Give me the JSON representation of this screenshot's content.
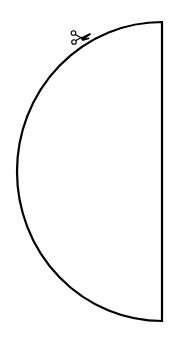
{
  "diagram": {
    "title": "Semicircle cut-out template",
    "shape": "half-circle",
    "stroke_color": "#000000",
    "background_color": "#ffffff",
    "straight_edge": {
      "x": 162,
      "y_top": 22,
      "y_bottom": 321
    },
    "arc": {
      "cx": 162,
      "cy": 171.5,
      "rx": 145,
      "ry": 149.5,
      "side": "left"
    },
    "cut_marker": {
      "icon": "scissors-icon",
      "x": 70,
      "y": 29
    }
  }
}
